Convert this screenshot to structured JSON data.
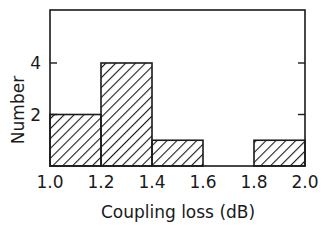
{
  "chart_data": {
    "type": "bar",
    "subtype": "histogram",
    "title": "",
    "xlabel": "Coupling loss (dB)",
    "ylabel": "Number",
    "bin_edges": [
      1.0,
      1.2,
      1.4,
      1.6,
      1.8,
      2.0
    ],
    "categories": [
      "1.0-1.2",
      "1.2-1.4",
      "1.4-1.6",
      "1.6-1.8",
      "1.8-2.0"
    ],
    "values": [
      2,
      4,
      1,
      0,
      1
    ],
    "x_ticks": [
      "1.0",
      "1.2",
      "1.4",
      "1.6",
      "1.8",
      "2.0"
    ],
    "y_ticks": [
      "2",
      "4"
    ],
    "xlim": [
      1.0,
      2.0
    ],
    "ylim": [
      0,
      6
    ],
    "grid": false,
    "fill": "diagonal hatch"
  },
  "axes": {
    "xlabel": "Coupling loss (dB)",
    "ylabel": "Number",
    "x_ticks": [
      "1.0",
      "1.2",
      "1.4",
      "1.6",
      "1.8",
      "2.0"
    ],
    "y_ticks": [
      "2",
      "4"
    ]
  }
}
